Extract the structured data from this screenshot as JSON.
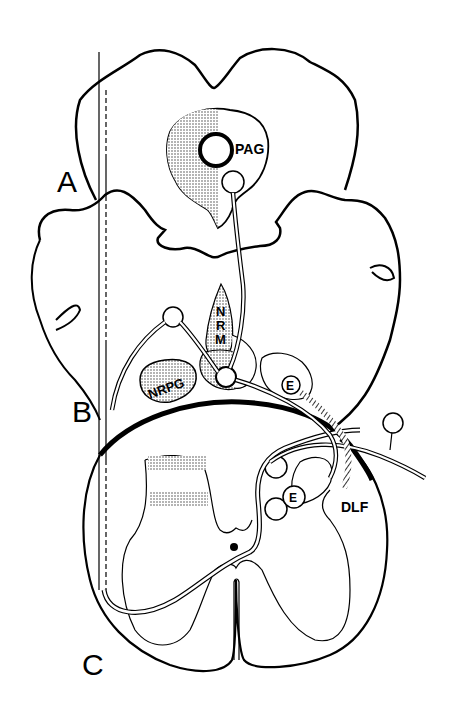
{
  "figure": {
    "type": "anatomical schematic",
    "panels": [
      {
        "id": "A",
        "label": "A",
        "region": "midbrain section"
      },
      {
        "id": "B",
        "label": "B",
        "region": "medulla section"
      },
      {
        "id": "C",
        "label": "C",
        "region": "spinal cord section"
      }
    ],
    "structure_labels": {
      "pag": "PAG",
      "nrm": "NRM",
      "nrm_letters": [
        "N",
        "R",
        "M"
      ],
      "nrpg": "NRPG",
      "enkephalin_medulla": "E",
      "enkephalin_spinal": "E",
      "dlf": "DLF"
    },
    "colors": {
      "ink": "#000000",
      "background": "#ffffff",
      "stipple": "#555555"
    }
  }
}
